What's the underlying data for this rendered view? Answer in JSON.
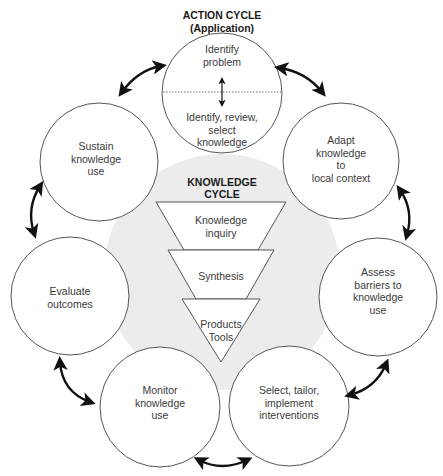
{
  "action_cycle": {
    "title": "ACTION CYCLE",
    "subtitle": "(Application)",
    "top_circle": {
      "upper_label": "Identify problem",
      "upper_lines": [
        "Identify",
        "problem"
      ],
      "lower_lines": [
        "Identify, review,",
        "select",
        "knowledge"
      ]
    },
    "steps": [
      {
        "id": "adapt",
        "lines": [
          "Adapt",
          "knowledge",
          "to",
          "local context"
        ]
      },
      {
        "id": "assess",
        "lines": [
          "Assess",
          "barriers to",
          "knowledge",
          "use"
        ]
      },
      {
        "id": "select",
        "lines": [
          "Select, tailor,",
          "implement",
          "interventions"
        ]
      },
      {
        "id": "monitor",
        "lines": [
          "Monitor",
          "knowledge",
          "use"
        ]
      },
      {
        "id": "evaluate",
        "lines": [
          "Evaluate",
          "outcomes"
        ]
      },
      {
        "id": "sustain",
        "lines": [
          "Sustain",
          "knowledge",
          "use"
        ]
      }
    ]
  },
  "knowledge_cycle": {
    "title_lines": [
      "KNOWLEDGE",
      "CYCLE"
    ],
    "funnel": [
      {
        "id": "inquiry",
        "lines": [
          "Knowledge",
          "inquiry"
        ]
      },
      {
        "id": "synthesis",
        "lines": [
          "Synthesis"
        ]
      },
      {
        "id": "products",
        "lines": [
          "Products",
          "Tools"
        ]
      }
    ]
  },
  "colors": {
    "background_circle": "#ededed",
    "stroke": "#555555",
    "arrow": "#111111"
  }
}
